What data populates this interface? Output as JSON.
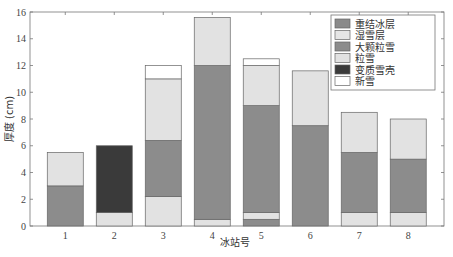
{
  "chart_data": {
    "type": "bar",
    "stacked": true,
    "title": "",
    "xlabel": "冰站号",
    "ylabel": "厚度 (cm)",
    "ylim": [
      0,
      16
    ],
    "yticks": [
      0,
      2,
      4,
      6,
      8,
      10,
      12,
      14,
      16
    ],
    "categories": [
      "1",
      "2",
      "3",
      "4",
      "5",
      "6",
      "7",
      "8"
    ],
    "grid": false,
    "legend_position": "upper right",
    "legend": [
      {
        "name": "重结冰层",
        "color": "#8a8a8a"
      },
      {
        "name": "湿雪层",
        "color": "#e6e6e6"
      },
      {
        "name": "大颗粒雪",
        "color": "#8c8c8c"
      },
      {
        "name": "粒雪",
        "color": "#e2e2e2"
      },
      {
        "name": "变质雪壳",
        "color": "#3a3a3a"
      },
      {
        "name": "新雪",
        "color": "#ffffff"
      }
    ],
    "stacks": [
      {
        "station": "1",
        "layers": [
          {
            "type": "大颗粒雪",
            "from": 0,
            "to": 3.0
          },
          {
            "type": "粒雪",
            "from": 3.0,
            "to": 5.5
          }
        ]
      },
      {
        "station": "2",
        "layers": [
          {
            "type": "粒雪",
            "from": 0,
            "to": 1.0
          },
          {
            "type": "变质雪壳",
            "from": 1.0,
            "to": 6.0
          }
        ]
      },
      {
        "station": "3",
        "layers": [
          {
            "type": "粒雪",
            "from": 0,
            "to": 2.2
          },
          {
            "type": "大颗粒雪",
            "from": 2.2,
            "to": 6.4
          },
          {
            "type": "粒雪",
            "from": 6.4,
            "to": 11.0
          },
          {
            "type": "新雪",
            "from": 11.0,
            "to": 12.0
          }
        ]
      },
      {
        "station": "4",
        "layers": [
          {
            "type": "粒雪",
            "from": 0,
            "to": 0.5
          },
          {
            "type": "大颗粒雪",
            "from": 0.5,
            "to": 12.0
          },
          {
            "type": "粒雪",
            "from": 12.0,
            "to": 15.6
          }
        ]
      },
      {
        "station": "5",
        "layers": [
          {
            "type": "大颗粒雪",
            "from": 0,
            "to": 0.5
          },
          {
            "type": "粒雪",
            "from": 0.5,
            "to": 1.0
          },
          {
            "type": "大颗粒雪",
            "from": 1.0,
            "to": 9.0
          },
          {
            "type": "粒雪",
            "from": 9.0,
            "to": 12.0
          },
          {
            "type": "新雪",
            "from": 12.0,
            "to": 12.5
          }
        ]
      },
      {
        "station": "6",
        "layers": [
          {
            "type": "大颗粒雪",
            "from": 0,
            "to": 7.5
          },
          {
            "type": "粒雪",
            "from": 7.5,
            "to": 11.6
          }
        ]
      },
      {
        "station": "7",
        "layers": [
          {
            "type": "粒雪",
            "from": 0,
            "to": 1.0
          },
          {
            "type": "大颗粒雪",
            "from": 1.0,
            "to": 5.5
          },
          {
            "type": "粒雪",
            "from": 5.5,
            "to": 8.5
          }
        ]
      },
      {
        "station": "8",
        "layers": [
          {
            "type": "粒雪",
            "from": 0,
            "to": 1.0
          },
          {
            "type": "大颗粒雪",
            "from": 1.0,
            "to": 5.0
          },
          {
            "type": "粒雪",
            "from": 5.0,
            "to": 8.0
          }
        ]
      }
    ],
    "totals": [
      5.5,
      6.0,
      12.0,
      15.6,
      12.5,
      11.6,
      8.5,
      8.0
    ]
  }
}
